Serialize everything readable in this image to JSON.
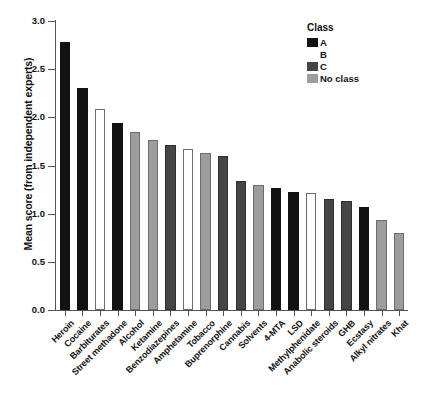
{
  "chart_data": {
    "type": "bar",
    "title": "",
    "xlabel": "",
    "ylabel": "Mean score (from independent experts)",
    "ylim": [
      0.0,
      3.0
    ],
    "yticks": [
      "0.0",
      "0.5",
      "1.0",
      "1.5",
      "2.0",
      "2.5",
      "3.0"
    ],
    "grid": false,
    "legend_position": "top-right",
    "legend_title": "Class",
    "legend_entries": [
      {
        "label": "A",
        "class_key": "A",
        "color": "#121212"
      },
      {
        "label": "B",
        "class_key": "B",
        "color": "#ffffff"
      },
      {
        "label": "C",
        "class_key": "C",
        "color": "#454545"
      },
      {
        "label": "No class",
        "class_key": "N",
        "color": "#9d9d9d"
      }
    ],
    "categories": [
      "Heroin",
      "Cocaine",
      "Barbiturates",
      "Street methadone",
      "Alcohol",
      "Ketamine",
      "Benzodiazepines",
      "Amphetamine",
      "Tobacco",
      "Buprenorphine",
      "Cannabis",
      "Solvents",
      "4-MTA",
      "LSD",
      "Methylphenidate",
      "Anabolic steroids",
      "GHB",
      "Ecstasy",
      "Alkyl nitrates",
      "Khat"
    ],
    "values": [
      2.78,
      2.3,
      2.09,
      1.94,
      1.85,
      1.76,
      1.71,
      1.67,
      1.63,
      1.6,
      1.34,
      1.3,
      1.27,
      1.23,
      1.21,
      1.15,
      1.13,
      1.07,
      0.93,
      0.8
    ],
    "bar_classes": [
      "A",
      "A",
      "B",
      "A",
      "N",
      "N",
      "C",
      "B",
      "N",
      "C",
      "C",
      "N",
      "A",
      "A",
      "B",
      "C",
      "C",
      "A",
      "N",
      "N"
    ]
  }
}
